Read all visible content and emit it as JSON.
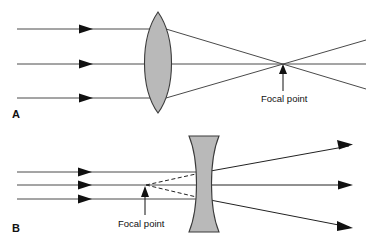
{
  "figure": {
    "background_color": "#ffffff",
    "width": 373,
    "height": 245
  },
  "colors": {
    "lens_fill": "#b9b9b9",
    "lens_stroke": "#3a3a3a",
    "ray_stroke": "#4a4a4a",
    "ray_dark": "#222222",
    "text": "#111111"
  },
  "panels": [
    {
      "id": "A",
      "label": "A",
      "lens_type": "biconvex-converging-lens",
      "focal_point": {
        "label": "Focal point",
        "kind": "real",
        "x": 283,
        "y": 64
      },
      "incoming_rays": [
        {
          "y": 29,
          "x_start": 17,
          "x_end": 158,
          "arrow_x": 90
        },
        {
          "y": 64,
          "x_start": 17,
          "x_end": 158,
          "arrow_x": 90
        },
        {
          "y": 98,
          "x_start": 17,
          "x_end": 158,
          "arrow_x": 90
        }
      ],
      "refracted_rays": [
        {
          "from_y": 29,
          "through": [
            283,
            64
          ],
          "to_x": 366,
          "to_y": 89
        },
        {
          "from_y": 64,
          "through": [
            283,
            64
          ],
          "to_x": 366,
          "to_y": 64
        },
        {
          "from_y": 98,
          "through": [
            283,
            64
          ],
          "to_x": 366,
          "to_y": 40
        }
      ]
    },
    {
      "id": "B",
      "label": "B",
      "lens_type": "biconcave-diverging-lens",
      "focal_point": {
        "label": "Focal point",
        "kind": "virtual",
        "x": 145,
        "y": 185
      },
      "incoming_rays": [
        {
          "y": 172,
          "x_start": 17,
          "x_end": 200,
          "arrow_x": 89
        },
        {
          "y": 185,
          "x_start": 17,
          "x_end": 200,
          "arrow_x": 89
        },
        {
          "y": 199,
          "x_start": 17,
          "x_end": 200,
          "arrow_x": 89
        }
      ],
      "diverged_rays": [
        {
          "from_y": 172,
          "to_x": 352,
          "to_y": 145
        },
        {
          "from_y": 185,
          "to_x": 352,
          "to_y": 185
        },
        {
          "from_y": 199,
          "to_x": 352,
          "to_y": 228
        }
      ],
      "virtual_ray_extensions": [
        {
          "from_x": 145,
          "from_y": 185,
          "to_x": 204,
          "to_y": 172
        },
        {
          "from_x": 145,
          "from_y": 185,
          "to_x": 204,
          "to_y": 199
        }
      ]
    }
  ]
}
